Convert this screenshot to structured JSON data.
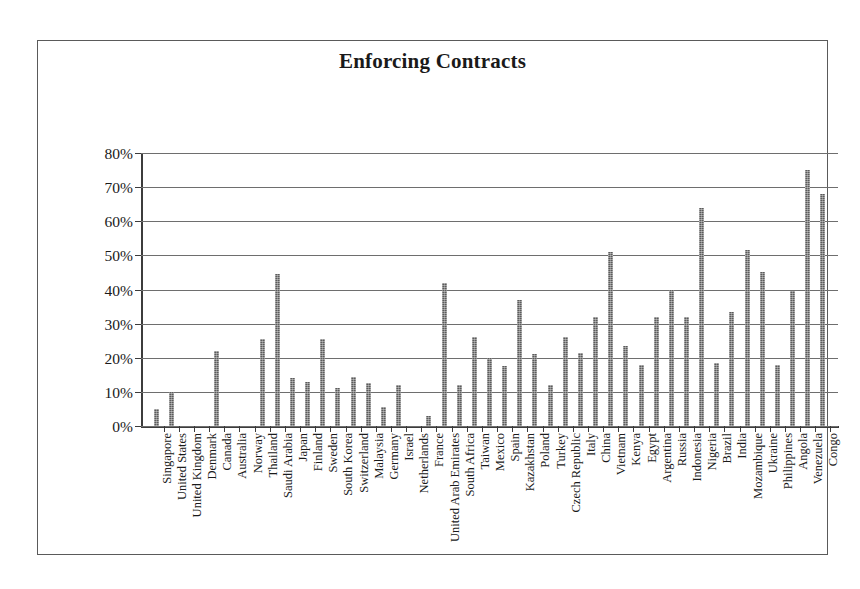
{
  "chart_data": {
    "type": "bar",
    "title": "Enforcing Contracts",
    "xlabel": "",
    "ylabel": "",
    "ylim": [
      0,
      80
    ],
    "ytick_labels": [
      "80%",
      "70%",
      "60%",
      "50%",
      "40%",
      "30%",
      "20%",
      "10%",
      "0%"
    ],
    "ytick_values": [
      80,
      70,
      60,
      50,
      40,
      30,
      20,
      10,
      0
    ],
    "grid": true,
    "legend": false,
    "value_unit": "%",
    "bar_color": "#5b5b5b",
    "categories": [
      "Singapore",
      "United States",
      "United Kingdom",
      "Denmark",
      "Canada",
      "Australia",
      "Norway",
      "Thailand",
      "Saudi Arabia",
      "Japan",
      "Finland",
      "Sweden",
      "South Korea",
      "Switzerland",
      "Malaysia",
      "Germany",
      "Israel",
      "Netherlands",
      "France",
      "United Arab Emirates",
      "South Africa",
      "Taiwan",
      "Mexico",
      "Spain",
      "Kazakhstan",
      "Poland",
      "Turkey",
      "Czech Republic",
      "Italy",
      "China",
      "Vietnam",
      "Kenya",
      "Egypt",
      "Argentina",
      "Russia",
      "Indonesia",
      "Nigeria",
      "Brazil",
      "India",
      "Mozambique",
      "Ukraine",
      "Philippines",
      "Angola",
      "Venezuela",
      "Congo"
    ],
    "values": [
      5.0,
      10.0,
      0.0,
      0.0,
      22.0,
      0.0,
      0.0,
      25.5,
      44.5,
      14.0,
      13.0,
      25.5,
      11.0,
      14.5,
      12.5,
      5.5,
      12.0,
      0.0,
      3.0,
      42.0,
      12.0,
      26.0,
      20.0,
      17.5,
      37.0,
      21.0,
      12.0,
      26.0,
      21.5,
      32.0,
      51.0,
      23.5,
      18.0,
      32.0,
      40.0,
      32.0,
      64.0,
      18.5,
      33.5,
      51.5,
      45.0,
      18.0,
      39.5,
      75.0,
      68.0
    ]
  }
}
